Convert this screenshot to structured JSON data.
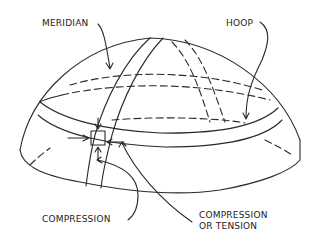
{
  "diagram": {
    "labels": {
      "meridian": "MERIDIAN",
      "hoop": "HOOP",
      "compression": "COMPRESSION",
      "compression_or_tension_line1": "COMPRESSION",
      "compression_or_tension_line2": "OR TENSION"
    },
    "colors": {
      "ink": "#2a2a2a",
      "background": "#ffffff"
    }
  }
}
